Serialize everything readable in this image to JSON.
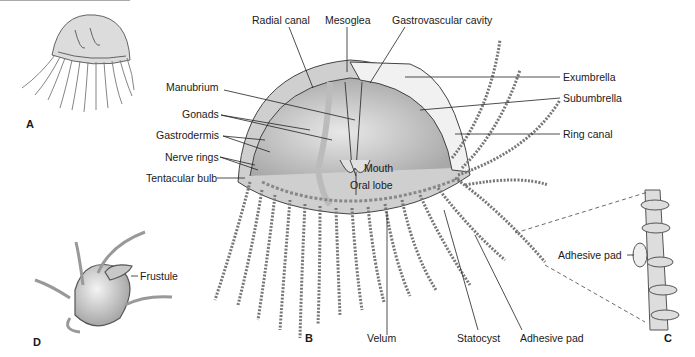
{
  "figure": {
    "panels": [
      {
        "id": "A",
        "label": "A",
        "description": "Whole hydromedusa, external view"
      },
      {
        "id": "B",
        "label": "B",
        "description": "Cutaway hydromedusa anatomy"
      },
      {
        "id": "C",
        "label": "C",
        "description": "Enlarged tentacle segment"
      },
      {
        "id": "D",
        "label": "D",
        "description": "Polyp with frustule"
      }
    ],
    "labels_b": {
      "radial_canal": "Radial canal",
      "mesoglea": "Mesoglea",
      "gastrovascular_cavity": "Gastrovascular cavity",
      "exumbrella": "Exumbrella",
      "subumbrella": "Subumbrella",
      "ring_canal": "Ring canal",
      "manubrium": "Manubrium",
      "gonads": "Gonads",
      "gastrodermis": "Gastrodermis",
      "nerve_rings": "Nerve rings",
      "tentacular_bulb": "Tentacular bulb",
      "mouth": "Mouth",
      "oral_lobe": "Oral lobe",
      "velum": "Velum",
      "statocyst": "Statocyst",
      "adhesive_pad": "Adhesive pad"
    },
    "labels_c": {
      "adhesive_pad": "Adhesive pad"
    },
    "labels_d": {
      "frustule": "Frustule"
    }
  }
}
